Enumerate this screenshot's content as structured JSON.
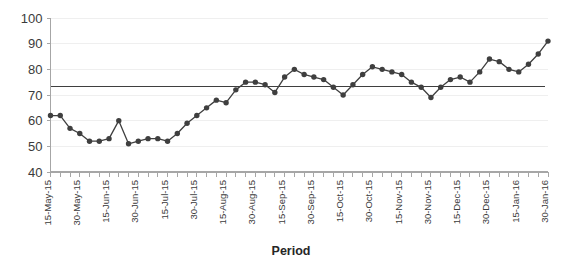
{
  "chart_data": {
    "type": "line",
    "title": "",
    "xlabel": "Period",
    "ylabel": "",
    "ylim": [
      40,
      100
    ],
    "ytick_step": 10,
    "yticks": [
      40,
      50,
      60,
      70,
      80,
      90,
      100
    ],
    "grid": true,
    "legend": false,
    "series_color": "#3f3f3f",
    "reference_line": {
      "label": "",
      "value": 73.2,
      "color": "#3f3f3f"
    },
    "x_tick_labels": [
      "15-May-15",
      "30-May-15",
      "15-Jun-15",
      "30-Jun-15",
      "15-Jul-15",
      "30-Jul-15",
      "15-Aug-15",
      "30-Aug-15",
      "15-Sep-15",
      "30-Sep-15",
      "15-Oct-15",
      "30-Oct-15",
      "15-Nov-15",
      "30-Nov-15",
      "15-Dec-15",
      "30-Dec-15",
      "15-Jan-16",
      "30-Jan-16"
    ],
    "x_label_every": 3,
    "categories": [
      "15-May-15",
      "20-May-15",
      "25-May-15",
      "30-May-15",
      "5-Jun-15",
      "10-Jun-15",
      "15-Jun-15",
      "20-Jun-15",
      "25-Jun-15",
      "30-Jun-15",
      "5-Jul-15",
      "10-Jul-15",
      "15-Jul-15",
      "20-Jul-15",
      "25-Jul-15",
      "30-Jul-15",
      "5-Aug-15",
      "10-Aug-15",
      "15-Aug-15",
      "20-Aug-15",
      "25-Aug-15",
      "30-Aug-15",
      "5-Sep-15",
      "10-Sep-15",
      "15-Sep-15",
      "20-Sep-15",
      "25-Sep-15",
      "30-Sep-15",
      "5-Oct-15",
      "10-Oct-15",
      "15-Oct-15",
      "20-Oct-15",
      "25-Oct-15",
      "30-Oct-15",
      "5-Nov-15",
      "10-Nov-15",
      "15-Nov-15",
      "20-Nov-15",
      "25-Nov-15",
      "30-Nov-15",
      "5-Dec-15",
      "10-Dec-15",
      "15-Dec-15",
      "20-Dec-15",
      "25-Dec-15",
      "30-Dec-15",
      "5-Jan-16",
      "10-Jan-16",
      "15-Jan-16",
      "20-Jan-16",
      "25-Jan-16",
      "30-Jan-16"
    ],
    "values": [
      62,
      62,
      57,
      55,
      52,
      52,
      53,
      60,
      51,
      52,
      53,
      53,
      52,
      55,
      59,
      62,
      65,
      68,
      67,
      72,
      75,
      75,
      74,
      71,
      77,
      80,
      78,
      77,
      76,
      73,
      70,
      74,
      78,
      81,
      80,
      79,
      78,
      75,
      73,
      69,
      73,
      76,
      77,
      75,
      79,
      84,
      83,
      80,
      79,
      82,
      86,
      91
    ]
  }
}
